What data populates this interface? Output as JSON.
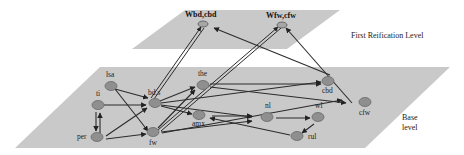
{
  "levels": {
    "upper": "First Reification Level",
    "base_line1": "Base",
    "base_line2": "level"
  },
  "reified_nodes": [
    {
      "id": "wbd",
      "label": "Wbd,cbd"
    },
    {
      "id": "wfw",
      "label": "Wfw,cfw"
    }
  ],
  "base_nodes": [
    {
      "id": "lsa",
      "label": "lsa"
    },
    {
      "id": "ti",
      "label": "ti"
    },
    {
      "id": "per",
      "label": "per"
    },
    {
      "id": "bds",
      "label": "bd.s"
    },
    {
      "id": "fw",
      "label": "fw"
    },
    {
      "id": "the",
      "label": "the"
    },
    {
      "id": "amx",
      "label": "amx"
    },
    {
      "id": "nl",
      "label": "nl"
    },
    {
      "id": "wl",
      "label": "wl"
    },
    {
      "id": "rul",
      "label": "rul"
    },
    {
      "id": "cbd",
      "label": "cbd"
    },
    {
      "id": "cfw",
      "label": "cfw"
    }
  ],
  "colors": {
    "plane": "#c9c9c9",
    "node": "#8f8f8f",
    "edge": "#2b2b2b"
  }
}
